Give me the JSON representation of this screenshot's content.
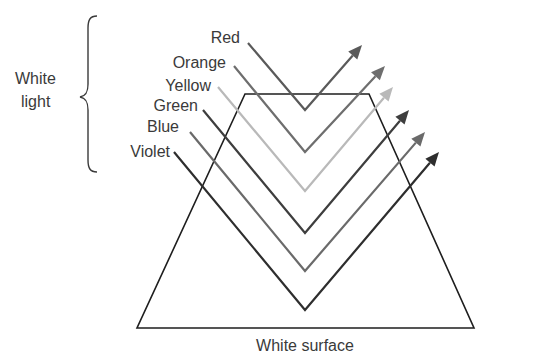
{
  "diagram": {
    "group_label_line1": "White",
    "group_label_line2": "light",
    "surface_label": "White surface",
    "rays": [
      {
        "name": "Red",
        "color": "#5a5a5a",
        "start": [
          248,
          43
        ],
        "vertex": [
          305,
          110
        ],
        "end": [
          362,
          45
        ]
      },
      {
        "name": "Orange",
        "color": "#6e6e6e",
        "start": [
          234,
          66
        ],
        "vertex": [
          305,
          152
        ],
        "end": [
          385,
          66
        ]
      },
      {
        "name": "Yellow",
        "color": "#b9b9b9",
        "start": [
          218,
          87
        ],
        "vertex": [
          305,
          191
        ],
        "end": [
          393,
          87
        ]
      },
      {
        "name": "Green",
        "color": "#3e3e3e",
        "start": [
          203,
          110
        ],
        "vertex": [
          305,
          233
        ],
        "end": [
          409,
          110
        ]
      },
      {
        "name": "Blue",
        "color": "#6a6a6a",
        "start": [
          190,
          132
        ],
        "vertex": [
          305,
          271
        ],
        "end": [
          425,
          132
        ]
      },
      {
        "name": "Violet",
        "color": "#2e2e2e",
        "start": [
          174,
          152
        ],
        "vertex": [
          305,
          310
        ],
        "end": [
          439,
          152
        ]
      }
    ],
    "surface_shape": {
      "type": "trapezoid",
      "points": [
        [
          245,
          94
        ],
        [
          369,
          94
        ],
        [
          474,
          328
        ],
        [
          137,
          328
        ]
      ],
      "color": "#1e1e1e"
    }
  }
}
